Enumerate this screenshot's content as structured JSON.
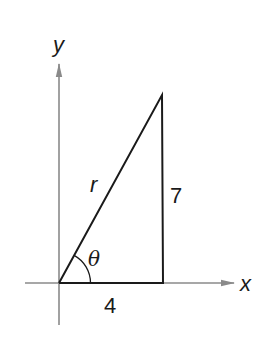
{
  "diagram": {
    "type": "right-triangle-on-axes",
    "axes": {
      "x_label": "x",
      "y_label": "y",
      "axis_color": "#8a8a8a"
    },
    "triangle": {
      "hypotenuse_label": "r",
      "opposite_label": "7",
      "adjacent_label": "4",
      "angle_label": "θ",
      "line_color": "#1a1a1a"
    }
  }
}
